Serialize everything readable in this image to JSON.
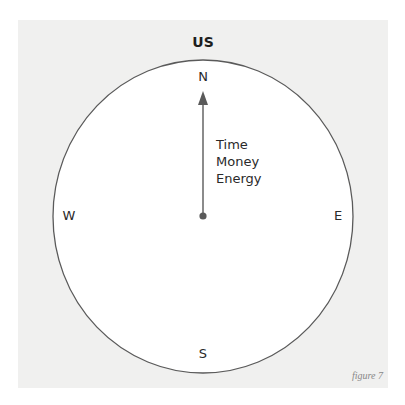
{
  "diagram": {
    "title": "US",
    "directions": {
      "north": "N",
      "south": "S",
      "west": "W",
      "east": "E"
    },
    "arrow": {
      "direction": "north",
      "labels": [
        "Time",
        "Money",
        "Energy"
      ]
    },
    "caption": "figure 7",
    "colors": {
      "panel": "#f0f0ef",
      "circle_fill": "#ffffff",
      "stroke": "#5a5a5a",
      "text": "#2a2a2a"
    }
  }
}
